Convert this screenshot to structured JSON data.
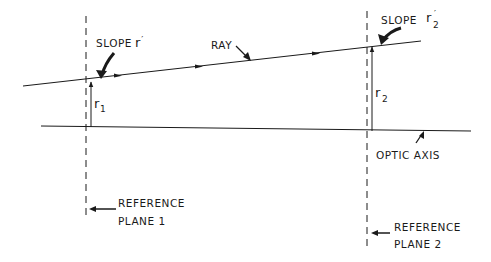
{
  "diagram": {
    "type": "optical ray transfer diagram",
    "labels": {
      "slope_left": "SLOPE",
      "slope_left_symbol": "r",
      "slope_left_prime": "′",
      "slope_right": "SLOPE",
      "slope_right_symbol": "r",
      "slope_right_sub": "2",
      "slope_right_prime": "′",
      "ray": "RAY",
      "r1_symbol": "r",
      "r1_sub": "1",
      "r2_symbol": "r",
      "r2_sub": "2",
      "optic_axis": "OPTIC AXIS",
      "ref_plane_1_line1": "REFERENCE",
      "ref_plane_1_line2": "PLANE 1",
      "ref_plane_2_line1": "REFERENCE",
      "ref_plane_2_line2": "PLANE 2"
    },
    "colors": {
      "ink": "#1a1a1a",
      "background": "#ffffff"
    }
  }
}
